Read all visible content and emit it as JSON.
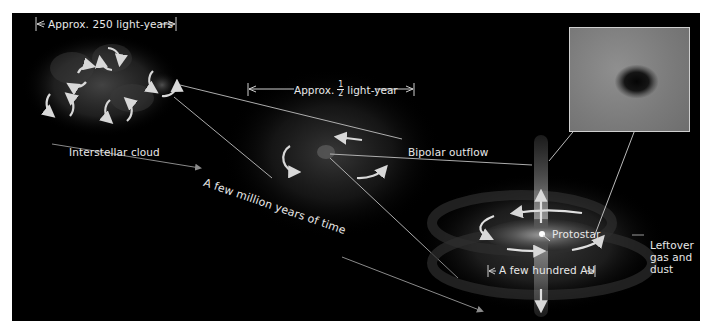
{
  "diagram": {
    "labels": {
      "cloud_scale": "Approx. 250 light-years",
      "core_scale_prefix": "Approx.",
      "core_scale_fraction_num": "1",
      "core_scale_fraction_den": "2",
      "core_scale_suffix": "light-year",
      "interstellar_cloud": "Interstellar cloud",
      "time_arrow": "A few million years of time",
      "bipolar_outflow": "Bipolar outflow",
      "protostar": "Protostar",
      "leftover_line1": "Leftover",
      "leftover_line2": "gas and",
      "leftover_line3": "dust",
      "disk_scale": "A few hundred AU"
    },
    "stages": [
      {
        "name": "Interstellar cloud",
        "scale": "Approx. 250 light-years"
      },
      {
        "name": "Collapsing dense core",
        "scale": "Approx. 1/2 light-year"
      },
      {
        "name": "Protostar with disk and bipolar outflow",
        "scale": "A few hundred AU"
      }
    ],
    "inset": {
      "description": "Photograph of dark protostellar globule"
    },
    "colors": {
      "background": "#000000",
      "page": "#ffffff",
      "text": "#e8e8e8",
      "arrows": "#d8d8d8",
      "leader_lines": "#bfbfbf",
      "time_arrow": "#8a8a8a",
      "inset_border": "#cfcfcf"
    }
  }
}
